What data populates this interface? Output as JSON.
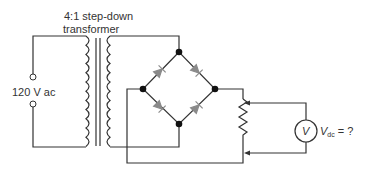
{
  "diagram": {
    "type": "bridge rectifier circuit",
    "transformer_label_line1": "4:1 step-down",
    "transformer_label_line2": "transformer",
    "source_label": "120 V ac",
    "meter_symbol": "V",
    "output_label_main": "V",
    "output_label_sub": "dc",
    "output_label_suffix": " = ?",
    "colors": {
      "wire": "#333333",
      "diode": "#8a8a8a",
      "node": "#111111"
    }
  }
}
